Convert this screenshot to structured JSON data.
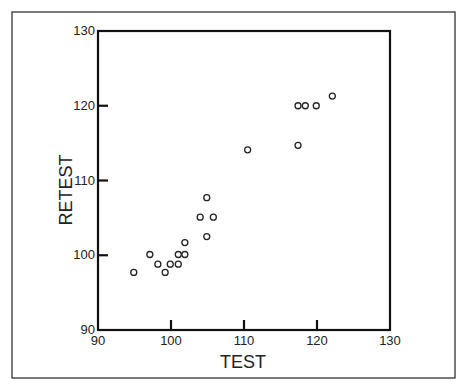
{
  "chart_data": {
    "type": "scatter",
    "title": "",
    "xlabel": "TEST",
    "ylabel": "RETEST",
    "xlim": [
      90,
      130
    ],
    "ylim": [
      90,
      130
    ],
    "x_ticks": [
      90,
      100,
      110,
      120,
      130
    ],
    "y_ticks": [
      90,
      100,
      110,
      120,
      130
    ],
    "x_tick_labels": [
      "90",
      "100",
      "110",
      "120",
      "130"
    ],
    "y_tick_labels": [
      "90",
      "100",
      "110",
      "120",
      "130"
    ],
    "grid": false,
    "legend": null,
    "marker": "open-circle",
    "series": [
      {
        "name": "TEST vs RETEST",
        "points": [
          {
            "x": 94.9,
            "y": 97.7
          },
          {
            "x": 97.1,
            "y": 100.1
          },
          {
            "x": 98.2,
            "y": 98.8
          },
          {
            "x": 99.2,
            "y": 97.7
          },
          {
            "x": 99.9,
            "y": 98.8
          },
          {
            "x": 101.0,
            "y": 98.8
          },
          {
            "x": 101.0,
            "y": 100.1
          },
          {
            "x": 101.9,
            "y": 100.1
          },
          {
            "x": 101.9,
            "y": 101.7
          },
          {
            "x": 104.0,
            "y": 105.1
          },
          {
            "x": 104.9,
            "y": 107.7
          },
          {
            "x": 105.8,
            "y": 105.1
          },
          {
            "x": 104.9,
            "y": 102.5
          },
          {
            "x": 110.5,
            "y": 114.1
          },
          {
            "x": 117.4,
            "y": 114.7
          },
          {
            "x": 117.4,
            "y": 120.0
          },
          {
            "x": 118.4,
            "y": 120.0
          },
          {
            "x": 119.9,
            "y": 120.0
          },
          {
            "x": 122.1,
            "y": 121.3
          }
        ]
      }
    ]
  }
}
